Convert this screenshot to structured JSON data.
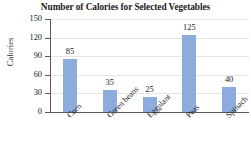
{
  "chart_data": {
    "type": "bar",
    "title": "Number of Calories for Selected Vegetables",
    "xlabel": "",
    "ylabel": "Calories",
    "categories": [
      "Corn",
      "Green beans",
      "Eggplant",
      "Peas",
      "Spinach"
    ],
    "values": [
      85,
      35,
      25,
      125,
      40
    ],
    "value_labels": [
      "85",
      "35",
      "25",
      "125",
      "40"
    ],
    "ylim": [
      0,
      150
    ],
    "yticks": [
      0,
      30,
      60,
      90,
      120,
      150
    ],
    "ytick_labels": [
      "0",
      "30",
      "60",
      "90",
      "120",
      "150"
    ],
    "grid": true,
    "legend": false,
    "series": [
      {
        "name": "Calories",
        "values": [
          85,
          35,
          25,
          125,
          40
        ]
      }
    ]
  },
  "colors": {
    "bar": "#8dacde",
    "axis": "#5a5a5a",
    "gridline": "#e4e4e4",
    "text": "#1a1a1a",
    "background": "#ffffff"
  }
}
